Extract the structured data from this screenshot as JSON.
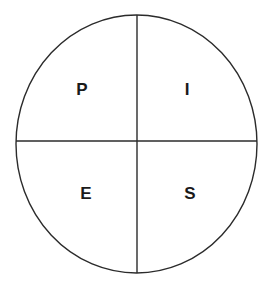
{
  "canvas": {
    "width": 274,
    "height": 289,
    "background_color": "#ffffff"
  },
  "diagram": {
    "name": "quartered-circle-letters",
    "shape": "circle",
    "stroke_color": "#2b2b2b",
    "stroke_width": 1.4,
    "fill_color": "#ffffff",
    "center_x": 136.5,
    "center_y": 144,
    "radius_x": 120.5,
    "radius_y": 129,
    "divider_lines": [
      {
        "name": "vertical-divider",
        "orientation": "vertical",
        "x": 137,
        "y1": 15,
        "y2": 273
      },
      {
        "name": "horizontal-divider",
        "orientation": "horizontal",
        "y": 141,
        "x1": 16,
        "x2": 257
      }
    ],
    "quadrants": [
      {
        "name": "top-left",
        "letter": "P",
        "x": 82,
        "y": 89
      },
      {
        "name": "top-right",
        "letter": "I",
        "x": 187,
        "y": 89
      },
      {
        "name": "bottom-left",
        "letter": "E",
        "x": 86,
        "y": 193
      },
      {
        "name": "bottom-right",
        "letter": "S",
        "x": 190,
        "y": 193
      }
    ],
    "letter_color": "#1a1a1a",
    "letter_font_size": 17
  }
}
